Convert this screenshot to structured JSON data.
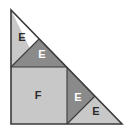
{
  "figure": {
    "name": "right-triangle-dissection",
    "canvas": {
      "width": 130,
      "height": 134
    },
    "background_color": "#ffffff",
    "colors": {
      "light_fill": "#c8c8c8",
      "dark_fill": "#8a8a8a",
      "outline": "#3a3a3a",
      "label_dark": "#2b2b2b",
      "label_light": "#ffffff"
    },
    "outer_triangle": {
      "name": "outer-right-triangle",
      "points": "11,10 11,124 122,124"
    },
    "pieces": [
      {
        "id": "piece-e-upper-left",
        "label": "E",
        "shade": "light",
        "points": "11,10 11,67 39,67",
        "label_x": 22,
        "label_y": 38,
        "label_color": "#2b2b2b"
      },
      {
        "id": "piece-e-upper-right",
        "label": "E",
        "shade": "dark",
        "points": "11,67 39,67 67,67 39,39",
        "label_x": 42,
        "label_y": 55,
        "label_color": "#ffffff"
      },
      {
        "id": "piece-f-square",
        "label": "F",
        "shade": "light",
        "points": "11,67 67,67 67,124 11,124",
        "label_x": 38,
        "label_y": 96,
        "label_color": "#2b2b2b"
      },
      {
        "id": "piece-e-middle-right",
        "label": "E",
        "shade": "dark",
        "points": "67,67 95,96 67,124",
        "label_x": 78,
        "label_y": 98,
        "label_color": "#ffffff"
      },
      {
        "id": "piece-e-lower-right",
        "label": "E",
        "shade": "light",
        "points": "67,124 95,96 122,124",
        "label_x": 96,
        "label_y": 112,
        "label_color": "#2b2b2b"
      }
    ],
    "internal_edges": [
      {
        "id": "edge-square-top",
        "x1": 11,
        "y1": 67,
        "x2": 67,
        "y2": 67
      },
      {
        "id": "edge-square-right",
        "x1": 67,
        "y1": 67,
        "x2": 67,
        "y2": 124
      },
      {
        "id": "edge-upper-diagonal",
        "x1": 11,
        "y1": 67,
        "x2": 39,
        "y2": 39
      },
      {
        "id": "edge-lower-diagonal",
        "x1": 67,
        "y1": 124,
        "x2": 95,
        "y2": 96
      }
    ]
  }
}
